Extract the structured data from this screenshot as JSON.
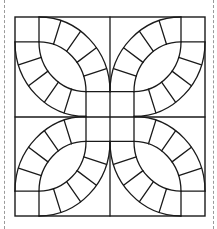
{
  "diagram": {
    "type": "quilt-block-pattern",
    "pattern_name": "",
    "line_color": "#1a1a1a",
    "background": "#ffffff",
    "cut_guide_color": "#9a9a9a",
    "layout": {
      "grid": "2x2 quadrants, mirrored",
      "quadrant_elements": [
        "corner-square",
        "melon-lens",
        "arc-band-upper (5 cells)",
        "arc-band-lower (5 cells)",
        "center-square"
      ]
    }
  }
}
